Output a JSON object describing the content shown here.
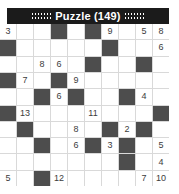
{
  "window": {
    "title": "Puzzle (149)",
    "title_bar_bg": "#1b1b1b",
    "title_bar_fg": "#ffffff",
    "left_dots": "::::::",
    "right_dots": "::::::"
  },
  "colors": {
    "grid_line": "#d9d9d9",
    "cell_bg": "#ffffff",
    "blocked_bg": "#4d4d4d",
    "number_fg": "#3c3c3c",
    "page_bg": "#ffffff"
  },
  "puzzle": {
    "type": "kakuro-style-number-grid",
    "rows": 10,
    "cols": 10,
    "cells": [
      [
        {
          "v": "3",
          "b": false
        },
        {
          "v": "",
          "b": false
        },
        {
          "v": "",
          "b": false
        },
        {
          "v": "",
          "b": true
        },
        {
          "v": "",
          "b": false
        },
        {
          "v": "",
          "b": true
        },
        {
          "v": "9",
          "b": false
        },
        {
          "v": "",
          "b": false
        },
        {
          "v": "5",
          "b": false
        },
        {
          "v": "8",
          "b": false
        }
      ],
      [
        {
          "v": "",
          "b": true
        },
        {
          "v": "",
          "b": false
        },
        {
          "v": "",
          "b": false
        },
        {
          "v": "",
          "b": false
        },
        {
          "v": "",
          "b": false
        },
        {
          "v": "",
          "b": false
        },
        {
          "v": "",
          "b": true
        },
        {
          "v": "",
          "b": false
        },
        {
          "v": "",
          "b": false
        },
        {
          "v": "6",
          "b": false
        }
      ],
      [
        {
          "v": "",
          "b": false
        },
        {
          "v": "",
          "b": false
        },
        {
          "v": "8",
          "b": false
        },
        {
          "v": "6",
          "b": false
        },
        {
          "v": "",
          "b": false
        },
        {
          "v": "",
          "b": true
        },
        {
          "v": "",
          "b": false
        },
        {
          "v": "",
          "b": false
        },
        {
          "v": "",
          "b": true
        },
        {
          "v": "",
          "b": false
        }
      ],
      [
        {
          "v": "",
          "b": true
        },
        {
          "v": "7",
          "b": false
        },
        {
          "v": "",
          "b": false
        },
        {
          "v": "",
          "b": true
        },
        {
          "v": "9",
          "b": false
        },
        {
          "v": "",
          "b": false
        },
        {
          "v": "",
          "b": false
        },
        {
          "v": "",
          "b": false
        },
        {
          "v": "",
          "b": false
        },
        {
          "v": "",
          "b": false
        }
      ],
      [
        {
          "v": "",
          "b": false
        },
        {
          "v": "",
          "b": false
        },
        {
          "v": "",
          "b": true
        },
        {
          "v": "6",
          "b": false
        },
        {
          "v": "",
          "b": true
        },
        {
          "v": "",
          "b": false
        },
        {
          "v": "",
          "b": false
        },
        {
          "v": "",
          "b": true
        },
        {
          "v": "4",
          "b": false
        },
        {
          "v": "",
          "b": false
        }
      ],
      [
        {
          "v": "",
          "b": true
        },
        {
          "v": "13",
          "b": false
        },
        {
          "v": "",
          "b": false
        },
        {
          "v": "",
          "b": false
        },
        {
          "v": "",
          "b": false
        },
        {
          "v": "11",
          "b": false
        },
        {
          "v": "",
          "b": false
        },
        {
          "v": "",
          "b": false
        },
        {
          "v": "",
          "b": false
        },
        {
          "v": "",
          "b": true
        }
      ],
      [
        {
          "v": "",
          "b": false
        },
        {
          "v": "",
          "b": true
        },
        {
          "v": "",
          "b": false
        },
        {
          "v": "",
          "b": false
        },
        {
          "v": "8",
          "b": false
        },
        {
          "v": "",
          "b": false
        },
        {
          "v": "",
          "b": true
        },
        {
          "v": "2",
          "b": false
        },
        {
          "v": "",
          "b": true
        },
        {
          "v": "",
          "b": false
        }
      ],
      [
        {
          "v": "",
          "b": false
        },
        {
          "v": "",
          "b": false
        },
        {
          "v": "",
          "b": true
        },
        {
          "v": "",
          "b": false
        },
        {
          "v": "6",
          "b": false
        },
        {
          "v": "",
          "b": true
        },
        {
          "v": "3",
          "b": false
        },
        {
          "v": "",
          "b": true
        },
        {
          "v": "",
          "b": false
        },
        {
          "v": "5",
          "b": false
        }
      ],
      [
        {
          "v": "",
          "b": false
        },
        {
          "v": "",
          "b": false
        },
        {
          "v": "",
          "b": false
        },
        {
          "v": "",
          "b": false
        },
        {
          "v": "",
          "b": false
        },
        {
          "v": "",
          "b": false
        },
        {
          "v": "",
          "b": false
        },
        {
          "v": "",
          "b": true
        },
        {
          "v": "",
          "b": false
        },
        {
          "v": "4",
          "b": false
        }
      ],
      [
        {
          "v": "5",
          "b": false
        },
        {
          "v": "",
          "b": false
        },
        {
          "v": "",
          "b": true
        },
        {
          "v": "12",
          "b": false
        },
        {
          "v": "",
          "b": false
        },
        {
          "v": "",
          "b": false
        },
        {
          "v": "",
          "b": false
        },
        {
          "v": "",
          "b": false
        },
        {
          "v": "7",
          "b": false
        },
        {
          "v": "10",
          "b": false
        }
      ]
    ]
  }
}
